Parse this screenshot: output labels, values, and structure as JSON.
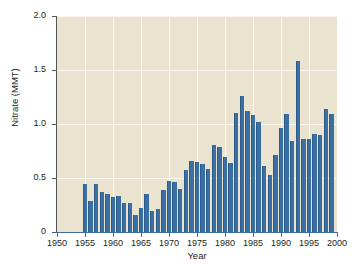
{
  "chart_data": {
    "type": "bar",
    "title": "",
    "xlabel": "Year",
    "ylabel": "Nitrate (MMT)",
    "xlim": [
      1950,
      2000
    ],
    "ylim": [
      0,
      2.0
    ],
    "grid": true,
    "legend": false,
    "bar_color": "#3a6fa4",
    "plot_background": "#eae3cf",
    "gridline_color": "#faf7ee",
    "y_ticks": [
      0,
      0.5,
      1.0,
      1.5,
      2.0
    ],
    "y_tick_labels": [
      "0",
      "0.5",
      "1.0",
      "1.5",
      "2.0"
    ],
    "x_ticks": [
      1950,
      1955,
      1960,
      1965,
      1970,
      1975,
      1980,
      1985,
      1990,
      1995,
      2000
    ],
    "x_tick_labels": [
      "1950",
      "1955",
      "1960",
      "1965",
      "1970",
      "1975",
      "1980",
      "1985",
      "1990",
      "1995",
      "2000"
    ],
    "categories": [
      1955,
      1956,
      1957,
      1958,
      1959,
      1960,
      1961,
      1962,
      1963,
      1964,
      1965,
      1966,
      1967,
      1968,
      1969,
      1970,
      1971,
      1972,
      1973,
      1974,
      1975,
      1976,
      1977,
      1978,
      1979,
      1980,
      1981,
      1982,
      1983,
      1984,
      1985,
      1986,
      1987,
      1988,
      1989,
      1990,
      1991,
      1992,
      1993,
      1994,
      1995,
      1996,
      1997,
      1998,
      1999
    ],
    "values": [
      0.44,
      0.29,
      0.44,
      0.37,
      0.35,
      0.32,
      0.33,
      0.27,
      0.27,
      0.16,
      0.22,
      0.35,
      0.19,
      0.21,
      0.39,
      0.47,
      0.46,
      0.4,
      0.57,
      0.66,
      0.65,
      0.63,
      0.58,
      0.81,
      0.79,
      0.69,
      0.64,
      1.1,
      1.26,
      1.12,
      1.08,
      1.02,
      0.61,
      0.53,
      0.71,
      0.96,
      1.09,
      0.84,
      1.58,
      0.86,
      0.86,
      0.91,
      0.9,
      1.14,
      1.09
    ]
  }
}
